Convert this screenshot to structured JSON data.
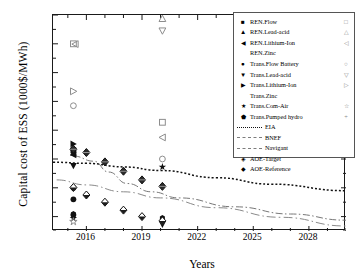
{
  "chart_data": {
    "type": "scatter",
    "title": "",
    "xlabel": "Years",
    "ylabel": "Capital cost of ESS (1000$/MWh)",
    "xlim": [
      2014.2,
      2030.0
    ],
    "ylim": [
      100,
      1600
    ],
    "xticks": [
      "2016",
      "2019",
      "2022",
      "2025",
      "2028"
    ],
    "xtick_values": [
      2016,
      2019,
      2022,
      2025,
      2028
    ],
    "yticks": [
      "200",
      "400",
      "600",
      "800",
      "1000",
      "1200",
      "1400",
      "1600"
    ],
    "ytick_values": [
      200,
      400,
      600,
      800,
      1000,
      1200,
      1400,
      1600
    ],
    "grid": false,
    "legend_position": "top-right",
    "series": [
      {
        "name": "REN.Flow",
        "marker": "filled-square",
        "points": [
          [
            2015.3,
            660
          ]
        ]
      },
      {
        "name": "REN.Lead-acid",
        "marker": "filled-triangle-up",
        "points": [
          [
            2015.3,
            645
          ]
        ]
      },
      {
        "name": "REN.Lithium-Ion",
        "marker": "filled-triangle-left",
        "points": [
          [
            2015.3,
            628
          ]
        ]
      },
      {
        "name": "REN.Zinc",
        "marker": "none",
        "points": []
      },
      {
        "name": "Trans.Flow Battery",
        "marker": "filled-circle",
        "points": [
          [
            2015.3,
            400
          ],
          [
            2015.3,
            320
          ],
          [
            2015.3,
            212
          ]
        ]
      },
      {
        "name": "Trans.Lead-acid",
        "marker": "filled-triangle-down",
        "points": [
          [
            2015.3,
            552
          ],
          [
            2020.1,
            145
          ]
        ]
      },
      {
        "name": "Trans.Lithium-Ion",
        "marker": "filled-triangle-right",
        "points": [
          [
            2015.3,
            705
          ]
        ]
      },
      {
        "name": "Trans.Zinc",
        "marker": "none",
        "points": []
      },
      {
        "name": "Trans.Com-Air",
        "marker": "filled-star",
        "points": [
          [
            2015.3,
            188
          ],
          [
            2020.1,
            545
          ]
        ]
      },
      {
        "name": "Trans.Pumped hydro",
        "marker": "filled-hexagon",
        "points": [
          [
            2015.3,
            218
          ],
          [
            2020.1,
            190
          ]
        ]
      },
      {
        "name": "REN.Flow (open)",
        "marker": "open-square",
        "points": [
          [
            2015.3,
            1400
          ],
          [
            2020.1,
            855
          ]
        ]
      },
      {
        "name": "REN.Lead-acid (open)",
        "marker": "open-triangle-up",
        "points": [
          [
            2020.1,
            1575
          ]
        ]
      },
      {
        "name": "REN.Lithium-Ion (open)",
        "marker": "open-triangle-left",
        "points": [
          [
            2015.4,
            1398
          ],
          [
            2020.1,
            750
          ]
        ]
      },
      {
        "name": "Trans.Flow Battery (open)",
        "marker": "open-circle",
        "points": [
          [
            2015.3,
            970
          ],
          [
            2020.1,
            600
          ]
        ]
      },
      {
        "name": "Trans.Lead-acid (open)",
        "marker": "open-triangle-down",
        "points": [
          [
            2020.1,
            1490
          ]
        ]
      },
      {
        "name": "Trans.Lithium-Ion (open)",
        "marker": "open-triangle-right",
        "points": [
          [
            2015.3,
            1070
          ]
        ]
      },
      {
        "name": "Trans.Com-Air (open)",
        "marker": "open-star",
        "points": [
          [
            2015.3,
            165
          ]
        ]
      },
      {
        "name": "AOE-Reference",
        "marker": "half-filled-diamond-dark",
        "points": [
          [
            2015.3,
            668
          ],
          [
            2016.0,
            645
          ],
          [
            2017.0,
            580
          ],
          [
            2018.0,
            515
          ],
          [
            2019.0,
            455
          ],
          [
            2020.1,
            410
          ]
        ]
      },
      {
        "name": "AOE-Target",
        "marker": "half-filled-diamond-light",
        "points": [
          [
            2015.3,
            402
          ],
          [
            2016.0,
            350
          ],
          [
            2017.0,
            300
          ],
          [
            2018.0,
            245
          ],
          [
            2019.0,
            200
          ],
          [
            2020.1,
            170
          ]
        ]
      }
    ],
    "lines": [
      {
        "name": "EIA",
        "style": "dotted",
        "color": "#111111",
        "points": [
          [
            2014.2,
            578
          ],
          [
            2016.0,
            570
          ],
          [
            2018.0,
            545
          ],
          [
            2020.0,
            520
          ],
          [
            2023.0,
            470
          ],
          [
            2026.0,
            425
          ],
          [
            2030.0,
            380
          ]
        ]
      },
      {
        "name": "BNEF",
        "style": "dash-dot",
        "color": "#777777",
        "points": [
          [
            2015.3,
            620
          ],
          [
            2016.4,
            585
          ],
          [
            2017.2,
            510
          ],
          [
            2018.2,
            430
          ],
          [
            2019.5,
            372
          ],
          [
            2021.0,
            330
          ],
          [
            2024.0,
            268
          ],
          [
            2027.0,
            218
          ],
          [
            2030.0,
            175
          ]
        ]
      },
      {
        "name": "Navigant",
        "style": "dash-dot-long",
        "color": "#8a8a8a",
        "points": [
          [
            2014.4,
            455
          ],
          [
            2016.0,
            420
          ],
          [
            2018.0,
            372
          ],
          [
            2020.0,
            330
          ],
          [
            2023.0,
            262
          ],
          [
            2026.5,
            195
          ],
          [
            2030.0,
            135
          ]
        ]
      }
    ]
  },
  "legend": {
    "marker_rows": [
      {
        "marker": "■",
        "label": "REN.Flow",
        "marker2": "□"
      },
      {
        "marker": "▲",
        "label": "REN.Lead-acid",
        "marker2": "△"
      },
      {
        "marker": "◀",
        "label": "REN.Lithium-Ion",
        "marker2": "◁"
      },
      {
        "marker": "",
        "label": "REN.Zinc",
        "marker2": ""
      },
      {
        "marker": "●",
        "label": "Trans.Flow Battery",
        "marker2": "○"
      },
      {
        "marker": "▼",
        "label": "Trans.Lead-acid",
        "marker2": "▽"
      },
      {
        "marker": "▶",
        "label": "Trans.Lithium-Ion",
        "marker2": "▷"
      },
      {
        "marker": "",
        "label": "Trans.Zinc",
        "marker2": ""
      },
      {
        "marker": "★",
        "label": "Trans.Com-Air",
        "marker2": "☆"
      },
      {
        "marker": "⬟",
        "label": "Trans.Pumped hydro",
        "marker2": "+"
      }
    ],
    "line_rows": [
      {
        "label": "EIA",
        "style": "dotted"
      },
      {
        "label": "BNEF",
        "style": "dash-dot"
      },
      {
        "label": "Navigant",
        "style": "dash-dot-long"
      }
    ],
    "diamond_rows": [
      {
        "marker": "◈",
        "label": "AOE-Target"
      },
      {
        "marker": "◆",
        "label": "AOE-Reference"
      }
    ]
  }
}
